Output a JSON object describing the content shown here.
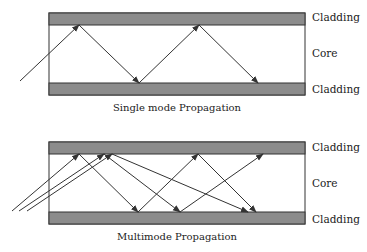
{
  "diagrams": [
    {
      "caption": "Single mode Propagation",
      "labels": {
        "top": "Cladding",
        "middle": "Core",
        "bottom": "Cladding"
      }
    },
    {
      "caption": "Multimode Propagation",
      "labels": {
        "top": "Cladding",
        "middle": "Core",
        "bottom": "Cladding"
      }
    }
  ],
  "colors": {
    "cladding": "#8c8c8c",
    "outline": "#333333",
    "ray": "#333333"
  }
}
